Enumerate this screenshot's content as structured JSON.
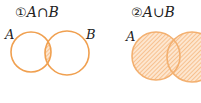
{
  "diagrams": [
    {
      "number": "①",
      "expression": "A∩B",
      "set_labels": {
        "left": "A",
        "right": "B"
      },
      "shaded_region": "intersection"
    },
    {
      "number": "②",
      "expression": "A∪B",
      "set_labels": {
        "left": "A"
      },
      "shaded_region": "union"
    }
  ],
  "colors": {
    "circle_stroke": "#f0a050",
    "hatch": "#f3b27a",
    "fill": "#fde6cf",
    "text": "#222222"
  }
}
